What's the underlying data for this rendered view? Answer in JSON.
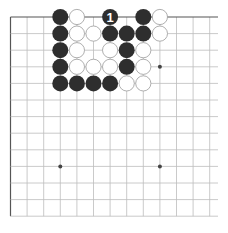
{
  "diagram": {
    "type": "go-board-corner",
    "grid": {
      "cols": 13,
      "rows": 13,
      "origin_x": 10.5,
      "origin_y": 17,
      "spacing": 16.6,
      "right_extent": 218,
      "line_color": "#bdbdbd",
      "edge_color": "#555555"
    },
    "star_points": [
      {
        "col": 9,
        "row": 3
      },
      {
        "col": 3,
        "row": 9
      },
      {
        "col": 9,
        "row": 9
      }
    ],
    "stones": [
      {
        "col": 3,
        "row": 0,
        "color": "black"
      },
      {
        "col": 3,
        "row": 1,
        "color": "black"
      },
      {
        "col": 3,
        "row": 2,
        "color": "black"
      },
      {
        "col": 3,
        "row": 3,
        "color": "black"
      },
      {
        "col": 3,
        "row": 4,
        "color": "black"
      },
      {
        "col": 4,
        "row": 0,
        "color": "white"
      },
      {
        "col": 4,
        "row": 1,
        "color": "white"
      },
      {
        "col": 4,
        "row": 2,
        "color": "white"
      },
      {
        "col": 4,
        "row": 3,
        "color": "white"
      },
      {
        "col": 4,
        "row": 4,
        "color": "black"
      },
      {
        "col": 5,
        "row": 1,
        "color": "white"
      },
      {
        "col": 5,
        "row": 3,
        "color": "white"
      },
      {
        "col": 5,
        "row": 4,
        "color": "black"
      },
      {
        "col": 6,
        "row": 0,
        "color": "black",
        "label": "1"
      },
      {
        "col": 6,
        "row": 1,
        "color": "black"
      },
      {
        "col": 6,
        "row": 2,
        "color": "white"
      },
      {
        "col": 6,
        "row": 3,
        "color": "white"
      },
      {
        "col": 6,
        "row": 4,
        "color": "black"
      },
      {
        "col": 7,
        "row": 1,
        "color": "black"
      },
      {
        "col": 7,
        "row": 2,
        "color": "black"
      },
      {
        "col": 7,
        "row": 3,
        "color": "black"
      },
      {
        "col": 7,
        "row": 4,
        "color": "white"
      },
      {
        "col": 8,
        "row": 0,
        "color": "black"
      },
      {
        "col": 8,
        "row": 1,
        "color": "black"
      },
      {
        "col": 8,
        "row": 2,
        "color": "white"
      },
      {
        "col": 8,
        "row": 3,
        "color": "white"
      },
      {
        "col": 8,
        "row": 4,
        "color": "white"
      },
      {
        "col": 9,
        "row": 0,
        "color": "white"
      },
      {
        "col": 9,
        "row": 1,
        "color": "white"
      }
    ],
    "colors": {
      "black_stone": "#2e2e2e",
      "white_stone": "#ffffff",
      "white_stone_border": "#9a9a9a",
      "label_on_black": "#ffffff"
    }
  }
}
